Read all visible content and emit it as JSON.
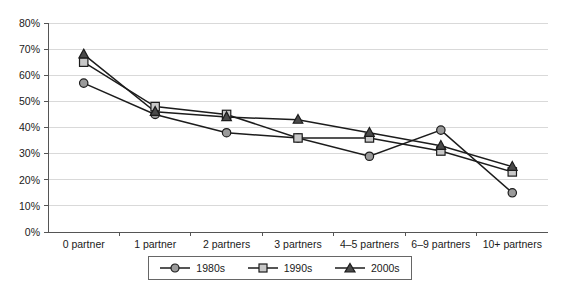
{
  "chart_data": {
    "type": "line",
    "title": "",
    "xlabel": "",
    "ylabel": "",
    "ylim": [
      0,
      80
    ],
    "ytick_values": [
      0,
      10,
      20,
      30,
      40,
      50,
      60,
      70,
      80
    ],
    "ytick_labels": [
      "0%",
      "10%",
      "20%",
      "30%",
      "40%",
      "50%",
      "60%",
      "70%",
      "80%"
    ],
    "grid": true,
    "legend_position": "bottom",
    "categories": [
      "0 partner",
      "1 partner",
      "2 partners",
      "3 partners",
      "4–5 partners",
      "6–9 partners",
      "10+ partners"
    ],
    "series": [
      {
        "name": "1980s",
        "marker": "circle",
        "marker_color": "#9a9a9a",
        "line_color": "#1c1c1c",
        "values": [
          57,
          45,
          38,
          36,
          29,
          39,
          15
        ]
      },
      {
        "name": "1990s",
        "marker": "square",
        "marker_color": "#c8c8c8",
        "line_color": "#1c1c1c",
        "values": [
          65,
          48,
          45,
          36,
          36,
          31,
          23
        ]
      },
      {
        "name": "2000s",
        "marker": "triangle",
        "marker_color": "#4a4a4a",
        "line_color": "#1c1c1c",
        "values": [
          68,
          46,
          44,
          43,
          38,
          33,
          25
        ]
      }
    ]
  },
  "legend": {
    "entries": [
      {
        "label": "1980s"
      },
      {
        "label": "1990s"
      },
      {
        "label": "2000s"
      }
    ]
  },
  "caption": {
    "text": ""
  }
}
